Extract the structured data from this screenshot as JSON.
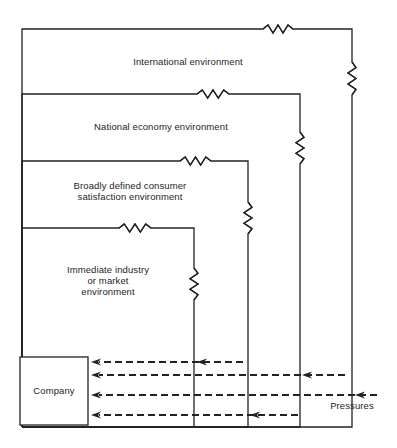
{
  "diagram": {
    "type": "nested-environment-diagram",
    "line_color": "#222222",
    "environments": [
      {
        "id": "international",
        "label_lines": [
          "International environment"
        ],
        "box": {
          "left": 22,
          "top": 29,
          "right": 352,
          "bottom": 427
        },
        "top_resistor": {
          "x1": 263,
          "x2": 293
        },
        "side_resistor": {
          "y1": 62,
          "y2": 95
        }
      },
      {
        "id": "national-economy",
        "label_lines": [
          "National economy environment"
        ],
        "box": {
          "left": 22,
          "top": 94,
          "right": 300,
          "bottom": 427
        },
        "top_resistor": {
          "x1": 197,
          "x2": 229
        },
        "side_resistor": {
          "y1": 132,
          "y2": 164
        }
      },
      {
        "id": "consumer-satisfaction",
        "label_lines": [
          "Broadly defined consumer",
          "satisfaction environment"
        ],
        "box": {
          "left": 22,
          "top": 161,
          "right": 248,
          "bottom": 427
        },
        "top_resistor": {
          "x1": 180,
          "x2": 211
        },
        "side_resistor": {
          "y1": 202,
          "y2": 234
        }
      },
      {
        "id": "immediate-industry",
        "label_lines": [
          "Immediate industry",
          "or market",
          "environment"
        ],
        "box": {
          "left": 22,
          "top": 228,
          "right": 194,
          "bottom": 427
        },
        "top_resistor": {
          "x1": 119,
          "x2": 151
        },
        "side_resistor": {
          "y1": 268,
          "y2": 300
        }
      }
    ],
    "company": {
      "label": "Company",
      "box": {
        "left": 20,
        "top": 357,
        "right": 88,
        "bottom": 425
      }
    },
    "pressures": {
      "label": "Pressures",
      "arrows": [
        {
          "y": 362,
          "from_x": 243,
          "to_x": 91,
          "mid_head_x": 197
        },
        {
          "y": 375,
          "from_x": 345,
          "to_x": 91,
          "mid_head_x": 302
        },
        {
          "y": 395,
          "from_x": 377,
          "to_x": 91,
          "mid_head_x": 355
        },
        {
          "y": 415,
          "from_x": 298,
          "to_x": 91,
          "mid_head_x": 250
        }
      ]
    }
  }
}
